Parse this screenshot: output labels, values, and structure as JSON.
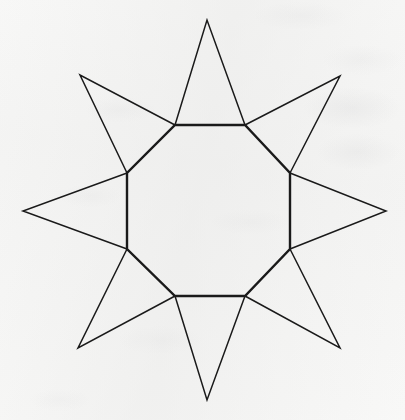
{
  "canvas": {
    "width": 405,
    "height": 420,
    "background_color": "#f9f9f8",
    "media": "scanned-paper"
  },
  "figure": {
    "name": "octagram-star-polygon",
    "ink_color": "#1a1a1a",
    "octagon_stroke_width": 2.4,
    "spike_stroke_width": 1.5,
    "center": {
      "x": 208,
      "y": 211
    },
    "octagon_circumradius": 92,
    "spike_circumradius": 190,
    "point_count": 8
  },
  "chart_data": {
    "type": "scatter",
    "title": "",
    "xlabel": "",
    "ylabel": "",
    "xlim": [
      0,
      405
    ],
    "ylim": [
      420,
      0
    ],
    "grid": false,
    "legend": "none",
    "series": [
      {
        "name": "octagon_vertices",
        "x": [
          175,
          245,
          290,
          290,
          245,
          175,
          127,
          127
        ],
        "y": [
          125,
          125,
          173,
          249,
          296,
          296,
          249,
          173
        ]
      },
      {
        "name": "spike_tips",
        "x": [
          207,
          340,
          386,
          340,
          207,
          78,
          23,
          80
        ],
        "y": [
          20,
          76,
          211,
          348,
          400,
          348,
          211,
          75
        ]
      }
    ]
  }
}
